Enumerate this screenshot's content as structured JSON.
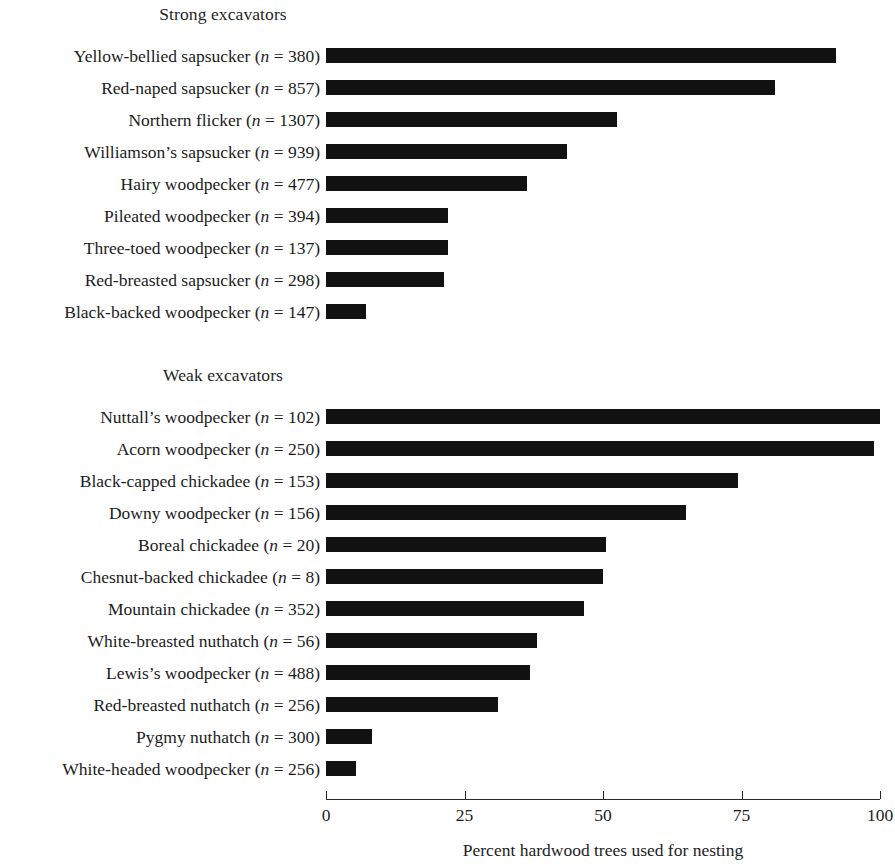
{
  "chart_data": {
    "type": "bar",
    "orientation": "horizontal",
    "title": "",
    "xlabel": "Percent hardwood trees used for nesting",
    "ylabel": "",
    "xlim": [
      0,
      100
    ],
    "xticks": [
      0,
      25,
      50,
      75,
      100
    ],
    "xtick_labels": [
      "0",
      "25",
      "50",
      "75",
      "100"
    ],
    "grid": false,
    "legend": null,
    "bar_color": "#111111",
    "groups": [
      {
        "name": "Strong excavators",
        "categories": [
          {
            "species": "Yellow-bellied sapsucker",
            "n": 380,
            "label": "Yellow-bellied sapsucker (n = 380)",
            "value": 92.0
          },
          {
            "species": "Red-naped sapsucker",
            "n": 857,
            "label": "Red-naped sapsucker (n = 857)",
            "value": 81.0
          },
          {
            "species": "Northern flicker",
            "n": 1307,
            "label": "Northern flicker (n = 1307)",
            "value": 52.5
          },
          {
            "species": "Williamson's sapsucker",
            "n": 939,
            "label": "Williamson’s sapsucker (n = 939)",
            "value": 43.5
          },
          {
            "species": "Hairy woodpecker",
            "n": 477,
            "label": "Hairy woodpecker (n = 477)",
            "value": 36.3
          },
          {
            "species": "Pileated woodpecker",
            "n": 394,
            "label": "Pileated woodpecker (n = 394)",
            "value": 22.0
          },
          {
            "species": "Three-toed woodpecker",
            "n": 137,
            "label": "Three-toed woodpecker (n = 137)",
            "value": 22.0
          },
          {
            "species": "Red-breasted sapsucker",
            "n": 298,
            "label": "Red-breasted sapsucker (n = 298)",
            "value": 21.3
          },
          {
            "species": "Black-backed woodpecker",
            "n": 147,
            "label": "Black-backed woodpecker (n = 147)",
            "value": 7.2
          }
        ]
      },
      {
        "name": "Weak excavators",
        "categories": [
          {
            "species": "Nuttall's woodpecker",
            "n": 102,
            "label": "Nuttall’s woodpecker (n = 102)",
            "value": 100.0
          },
          {
            "species": "Acorn woodpecker",
            "n": 250,
            "label": "Acorn woodpecker (n = 250)",
            "value": 99.0
          },
          {
            "species": "Black-capped chickadee",
            "n": 153,
            "label": "Black-capped chickadee (n = 153)",
            "value": 74.4
          },
          {
            "species": "Downy woodpecker",
            "n": 156,
            "label": "Downy woodpecker (n = 156)",
            "value": 65.0
          },
          {
            "species": "Boreal chickadee",
            "n": 20,
            "label": "Boreal chickadee (n = 20)",
            "value": 50.5
          },
          {
            "species": "Chesnut-backed chickadee",
            "n": 8,
            "label": "Chesnut-backed chickadee (n = 8)",
            "value": 50.0
          },
          {
            "species": "Mountain chickadee",
            "n": 352,
            "label": "Mountain chickadee (n = 352)",
            "value": 46.5
          },
          {
            "species": "White-breasted nuthatch",
            "n": 56,
            "label": "White-breasted nuthatch (n = 56)",
            "value": 38.0
          },
          {
            "species": "Lewis's woodpecker",
            "n": 488,
            "label": "Lewis’s woodpecker (n = 488)",
            "value": 36.8
          },
          {
            "species": "Red-breasted nuthatch",
            "n": 256,
            "label": "Red-breasted nuthatch (n = 256)",
            "value": 31.0
          },
          {
            "species": "Pygmy nuthatch",
            "n": 300,
            "label": "Pygmy nuthatch (n = 300)",
            "value": 8.3
          },
          {
            "species": "White-headed woodpecker",
            "n": 256,
            "label": "White-headed woodpecker (n = 256)",
            "value": 5.4
          }
        ]
      }
    ]
  }
}
